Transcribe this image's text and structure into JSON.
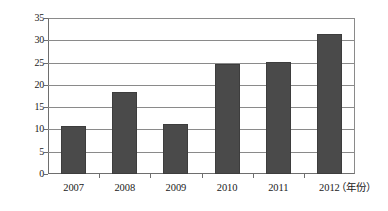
{
  "chart_data": {
    "type": "bar",
    "title": "",
    "xlabel": "（年份）",
    "ylabel": "",
    "categories": [
      "2007",
      "2008",
      "2009",
      "2010",
      "2011",
      "2012"
    ],
    "values": [
      10.8,
      18.4,
      11.3,
      24.6,
      25.2,
      31.4
    ],
    "ylim": [
      0,
      35
    ],
    "yticks": [
      0,
      5,
      10,
      15,
      20,
      25,
      30,
      35
    ],
    "ytick_labels": [
      "0",
      "5",
      "10",
      "15",
      "20",
      "25",
      "30",
      "35"
    ],
    "grid": true,
    "grid_axis": "y",
    "legend": false,
    "legend_position": "none",
    "bar_color": "#4a4a4a",
    "grid_color": "#8a8a8a",
    "axis_color": "#6e6e6e",
    "background_color": "#ffffff",
    "text_color": "#1a1a1a"
  }
}
